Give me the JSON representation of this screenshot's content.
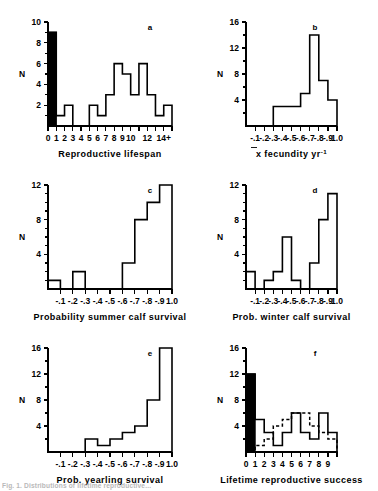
{
  "figure": {
    "title_partial": "Fig. 1.  Distributions of lifetime reproductive...",
    "panels": [
      {
        "letter": "a",
        "xtitle": "Reproductive  lifespan",
        "ytitle": "N"
      },
      {
        "letter": "b",
        "xtitle": "fecundity  yr",
        "xtitle_prefix": "x",
        "xtitle_sup": "-1",
        "ytitle": "N"
      },
      {
        "letter": "c",
        "xtitle": "Probability  summer  calf  survival",
        "ytitle": "N"
      },
      {
        "letter": "d",
        "xtitle": "Prob.  winter  calf  survival",
        "ytitle": "N"
      },
      {
        "letter": "e",
        "xtitle": "Prob.  yearling  survival",
        "ytitle": "N"
      },
      {
        "letter": "f",
        "xtitle": "Lifetime  reproductive  success",
        "ytitle": "N"
      }
    ]
  },
  "chart_data": [
    {
      "type": "bar",
      "panel": "a",
      "title": "",
      "xlabel": "Reproductive  lifespan",
      "ylabel": "N",
      "xlim": [
        0,
        15
      ],
      "ylim": [
        0,
        10
      ],
      "ytick_values": [
        2,
        4,
        6,
        8,
        10
      ],
      "ytick_labels": [
        "2",
        "4",
        "6",
        "8",
        "10"
      ],
      "ytick_minor_step": 1,
      "xtick_values": [
        0,
        1,
        2,
        3,
        4,
        5,
        6,
        7,
        8,
        9,
        10,
        11,
        12,
        13,
        14,
        15
      ],
      "xtick_labels": [
        "0",
        "1",
        "2",
        "3",
        "4",
        "5",
        "6",
        "7",
        "8",
        "9",
        "10",
        "",
        "12",
        "",
        "14+",
        ""
      ],
      "bin_edges": [
        0,
        1,
        2,
        3,
        4,
        5,
        6,
        7,
        8,
        9,
        10,
        11,
        12,
        13,
        14,
        15
      ],
      "values": [
        9,
        1,
        2,
        0,
        0,
        2,
        1,
        3,
        6,
        5,
        3,
        6,
        3,
        1,
        2
      ],
      "filled_bins": [
        0
      ],
      "fill_color": "#000000",
      "grid": false,
      "legend": false
    },
    {
      "type": "bar",
      "panel": "b",
      "title": "",
      "xlabel": "x fecundity yr-1",
      "ylabel": "N",
      "xlim": [
        0,
        1.0
      ],
      "ylim": [
        0,
        16
      ],
      "ytick_values": [
        4,
        8,
        12,
        16
      ],
      "ytick_labels": [
        "4",
        "8",
        "12",
        "16"
      ],
      "ytick_minor_step": 2,
      "xtick_values": [
        0.1,
        0.2,
        0.3,
        0.4,
        0.5,
        0.6,
        0.7,
        0.8,
        0.9,
        1.0
      ],
      "xtick_labels": [
        "-.1",
        "-.2",
        "-.3",
        "-.4",
        "-.5",
        "-.6",
        "-.7",
        "-.8",
        "-.9",
        "1.0"
      ],
      "bin_edges": [
        0,
        0.1,
        0.2,
        0.3,
        0.4,
        0.5,
        0.6,
        0.7,
        0.8,
        0.9,
        1.0
      ],
      "values": [
        0,
        0,
        0,
        3,
        3,
        3,
        5,
        14,
        7,
        4
      ],
      "filled_bins": [],
      "grid": false,
      "legend": false
    },
    {
      "type": "bar",
      "panel": "c",
      "title": "",
      "xlabel": "Probability  summer  calf  survival",
      "ylabel": "N",
      "xlim": [
        0,
        1.0
      ],
      "ylim": [
        0,
        12
      ],
      "ytick_values": [
        4,
        8,
        12
      ],
      "ytick_labels": [
        "4",
        "8",
        "12"
      ],
      "ytick_minor_step": 1,
      "xtick_values": [
        0.1,
        0.2,
        0.3,
        0.4,
        0.5,
        0.6,
        0.7,
        0.8,
        0.9,
        1.0
      ],
      "xtick_labels": [
        "-.1",
        "-.2",
        "-.3",
        "-.4",
        "-.5",
        "-.6",
        "-.7",
        "-.8",
        "-.9",
        "1.0"
      ],
      "bin_edges": [
        0,
        0.1,
        0.2,
        0.3,
        0.4,
        0.5,
        0.6,
        0.7,
        0.8,
        0.9,
        1.0
      ],
      "values": [
        1,
        0,
        2,
        0,
        0,
        0,
        3,
        8,
        10,
        12
      ],
      "filled_bins": [],
      "grid": false,
      "legend": false
    },
    {
      "type": "bar",
      "panel": "d",
      "title": "",
      "xlabel": "Prob.  winter  calf  survival",
      "ylabel": "N",
      "xlim": [
        0,
        1.0
      ],
      "ylim": [
        0,
        12
      ],
      "ytick_values": [
        4,
        8,
        12
      ],
      "ytick_labels": [
        "4",
        "8",
        "12"
      ],
      "ytick_minor_step": 1,
      "xtick_values": [
        0.1,
        0.2,
        0.3,
        0.4,
        0.5,
        0.6,
        0.7,
        0.8,
        0.9,
        1.0
      ],
      "xtick_labels": [
        "-.1",
        "-.2",
        "-.3",
        "-.4",
        "-.5",
        "-.6",
        "-.7",
        "-.8",
        "-.9",
        "1.0"
      ],
      "bin_edges": [
        0,
        0.1,
        0.2,
        0.3,
        0.4,
        0.5,
        0.6,
        0.7,
        0.8,
        0.9,
        1.0
      ],
      "values": [
        2,
        0,
        1,
        2,
        6,
        1,
        0,
        3,
        8,
        11
      ],
      "filled_bins": [],
      "grid": false,
      "legend": false
    },
    {
      "type": "bar",
      "panel": "e",
      "title": "",
      "xlabel": "Prob.  yearling  survival",
      "ylabel": "N",
      "xlim": [
        0,
        1.0
      ],
      "ylim": [
        0,
        16
      ],
      "ytick_values": [
        4,
        8,
        12,
        16
      ],
      "ytick_labels": [
        "4",
        "8",
        "12",
        "16"
      ],
      "ytick_minor_step": 2,
      "xtick_values": [
        0.1,
        0.2,
        0.3,
        0.4,
        0.5,
        0.6,
        0.7,
        0.8,
        0.9,
        1.0
      ],
      "xtick_labels": [
        "-.1",
        "-.2",
        "-.3",
        "-.4",
        "-.5",
        "-.6",
        "-.7",
        "-.8",
        "-.9",
        "1.0"
      ],
      "bin_edges": [
        0,
        0.1,
        0.2,
        0.3,
        0.4,
        0.5,
        0.6,
        0.7,
        0.8,
        0.9,
        1.0
      ],
      "values": [
        0,
        0,
        0,
        2,
        1,
        2,
        3,
        4,
        8,
        16
      ],
      "filled_bins": [],
      "grid": false,
      "legend": false
    },
    {
      "type": "bar",
      "panel": "f",
      "title": "",
      "xlabel": "Lifetime  reproductive  success",
      "ylabel": "N",
      "xlim": [
        0,
        10
      ],
      "ylim": [
        0,
        16
      ],
      "ytick_values": [
        4,
        8,
        12,
        16
      ],
      "ytick_labels": [
        "4",
        "8",
        "12",
        "16"
      ],
      "ytick_minor_step": 2,
      "xtick_values": [
        0,
        1,
        2,
        3,
        4,
        5,
        6,
        7,
        8,
        9,
        10
      ],
      "xtick_labels": [
        "0",
        "1",
        "2",
        "3",
        "4",
        "5",
        "6",
        "7",
        "8",
        "9",
        ""
      ],
      "bin_edges": [
        0,
        1,
        2,
        3,
        4,
        5,
        6,
        7,
        8,
        9,
        10
      ],
      "series": [
        {
          "name": "solid-histogram",
          "style": "solid",
          "values": [
            12,
            5,
            3,
            1,
            3,
            6,
            3,
            2,
            6,
            3
          ]
        },
        {
          "name": "dashed-histogram",
          "style": "dashed",
          "values": [
            0,
            1,
            2,
            4,
            5,
            6,
            6,
            4,
            3,
            2
          ]
        }
      ],
      "filled_bins": [
        0
      ],
      "fill_color": "#000000",
      "grid": false,
      "legend": false
    }
  ]
}
